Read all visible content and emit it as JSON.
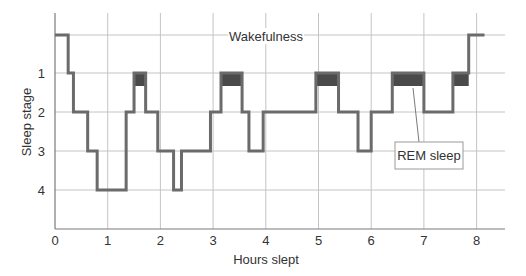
{
  "chart_data": {
    "type": "line",
    "subtype": "step",
    "title": "",
    "xlabel": "Hours slept",
    "ylabel": "Sleep stage",
    "xlim": [
      0,
      8.5
    ],
    "x_ticks": [
      0,
      1,
      2,
      3,
      4,
      5,
      6,
      7,
      8
    ],
    "x_tick_labels": [
      "0",
      "1",
      "2",
      "3",
      "4",
      "5",
      "6",
      "7",
      "8"
    ],
    "y_levels": [
      "Wakefulness",
      "1",
      "2",
      "3",
      "4"
    ],
    "y_tick_labels": [
      "1",
      "2",
      "3",
      "4"
    ],
    "grid": true,
    "series": [
      {
        "name": "Sleep stage over the night",
        "steps": [
          {
            "start": 0.0,
            "end": 0.25,
            "stage": "W"
          },
          {
            "start": 0.25,
            "end": 0.35,
            "stage": 1
          },
          {
            "start": 0.35,
            "end": 0.62,
            "stage": 2
          },
          {
            "start": 0.62,
            "end": 0.8,
            "stage": 3
          },
          {
            "start": 0.8,
            "end": 1.35,
            "stage": 4
          },
          {
            "start": 1.35,
            "end": 1.5,
            "stage": 2
          },
          {
            "start": 1.5,
            "end": 1.72,
            "stage": "1-REM"
          },
          {
            "start": 1.72,
            "end": 1.95,
            "stage": 2
          },
          {
            "start": 1.95,
            "end": 2.25,
            "stage": 3
          },
          {
            "start": 2.25,
            "end": 2.4,
            "stage": 4
          },
          {
            "start": 2.4,
            "end": 2.95,
            "stage": 3
          },
          {
            "start": 2.95,
            "end": 3.15,
            "stage": 2
          },
          {
            "start": 3.15,
            "end": 3.55,
            "stage": "1-REM"
          },
          {
            "start": 3.55,
            "end": 3.68,
            "stage": 2
          },
          {
            "start": 3.68,
            "end": 3.95,
            "stage": 3
          },
          {
            "start": 3.95,
            "end": 4.95,
            "stage": 2
          },
          {
            "start": 4.95,
            "end": 5.38,
            "stage": "1-REM"
          },
          {
            "start": 5.38,
            "end": 5.75,
            "stage": 2
          },
          {
            "start": 5.75,
            "end": 6.0,
            "stage": 3
          },
          {
            "start": 6.0,
            "end": 6.4,
            "stage": 2
          },
          {
            "start": 6.4,
            "end": 7.0,
            "stage": "1-REM"
          },
          {
            "start": 7.0,
            "end": 7.55,
            "stage": 2
          },
          {
            "start": 7.55,
            "end": 7.85,
            "stage": "1-REM"
          },
          {
            "start": 7.85,
            "end": 8.15,
            "stage": "W"
          }
        ]
      }
    ],
    "rem_periods": [
      {
        "start": 1.5,
        "end": 1.72
      },
      {
        "start": 3.15,
        "end": 3.55
      },
      {
        "start": 4.95,
        "end": 5.38
      },
      {
        "start": 6.4,
        "end": 7.0
      },
      {
        "start": 7.55,
        "end": 7.85
      }
    ],
    "annotations": [
      {
        "text": "Wakefulness",
        "type": "level-label"
      },
      {
        "text": "REM sleep",
        "type": "callout-box",
        "points_to": {
          "x": 6.7,
          "stage": 1
        }
      }
    ],
    "colors": {
      "trace": "#6b6b6b",
      "rem_fill": "#4a4a4a",
      "grid": "#c4c4c4",
      "axis": "#7a7a7a",
      "text": "#333333"
    }
  }
}
